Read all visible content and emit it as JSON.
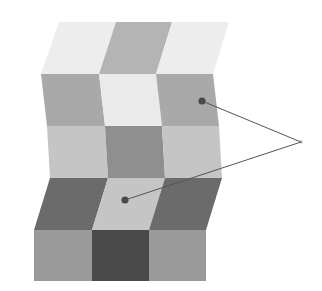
{
  "figure": {
    "kind": "wavy-checkerboard-lightness-illusion",
    "background_color": "#ffffff",
    "canvas": {
      "width": 322,
      "height": 291
    }
  },
  "palette": {
    "near_white": "#f1f1f1",
    "very_light_gray": "#e4e4e4",
    "light_gray": "#c9c9c9",
    "mid_light_gray": "#bdbdbd",
    "mid_gray": "#aaaaaa",
    "mid_dark_gray": "#949494",
    "dark_gray": "#6f6f6f",
    "darker_gray": "#5d5d5d",
    "darkest_gray": "#454545",
    "line_color": "#555555",
    "dot_color": "#4a4a4a"
  },
  "surface": {
    "columns": 3,
    "rows": 5,
    "description": "Folded wavy checkerboard surface rendered as sheared parallelogram tiles; alternating light and dark checks whose rendered luminance changes with the fold of the surface.",
    "column_top_x": [
      59,
      116,
      172
    ],
    "column_shear": [
      [
        0,
        0,
        0,
        0
      ],
      [
        0,
        0,
        0,
        0
      ],
      [
        0,
        0,
        0,
        0
      ]
    ],
    "row_boundaries_y": [
      22,
      74,
      126,
      178,
      230,
      281
    ],
    "tiles": [
      {
        "id": "r0c0",
        "row": 0,
        "col": 0,
        "check": "light",
        "fill": "#ededed",
        "points": "59,22 116,22 99,74 41,74"
      },
      {
        "id": "r0c1",
        "row": 0,
        "col": 1,
        "check": "dark",
        "fill": "#b4b4b4",
        "points": "116,22 172,22 156,74 99,74"
      },
      {
        "id": "r0c2",
        "row": 0,
        "col": 2,
        "check": "light",
        "fill": "#ededed",
        "points": "172,22 229,22 213,74 156,74"
      },
      {
        "id": "r1c0",
        "row": 1,
        "col": 0,
        "check": "dark",
        "fill": "#a9a9a9",
        "points": "41,74 99,74 105,126 47,126"
      },
      {
        "id": "r1c1",
        "row": 1,
        "col": 1,
        "check": "light",
        "fill": "#eaeaea",
        "points": "99,74 156,74 162,126 105,126"
      },
      {
        "id": "r1c2",
        "row": 1,
        "col": 2,
        "check": "dark",
        "fill": "#a9a9a9",
        "points": "156,74 213,74 219,126 162,126"
      },
      {
        "id": "r2c0",
        "row": 2,
        "col": 0,
        "check": "light",
        "fill": "#c5c5c5",
        "points": "47,126 105,126 108,178 50,178"
      },
      {
        "id": "r2c1",
        "row": 2,
        "col": 1,
        "check": "dark",
        "fill": "#8f8f8f",
        "points": "105,126 162,126 165,178 108,178"
      },
      {
        "id": "r2c2",
        "row": 2,
        "col": 2,
        "check": "light",
        "fill": "#c5c5c5",
        "points": "162,126 219,126 222,178 165,178"
      },
      {
        "id": "r3c0",
        "row": 3,
        "col": 0,
        "check": "dark",
        "fill": "#6b6b6b",
        "points": "50,178 108,178 92,230 34,230"
      },
      {
        "id": "r3c1",
        "row": 3,
        "col": 1,
        "check": "light",
        "fill": "#c5c5c5",
        "points": "108,178 165,178 149,230 92,230"
      },
      {
        "id": "r3c2",
        "row": 3,
        "col": 2,
        "check": "dark",
        "fill": "#6b6b6b",
        "points": "165,178 222,178 206,230 149,230"
      },
      {
        "id": "r4c0",
        "row": 4,
        "col": 0,
        "check": "light",
        "fill": "#9a9a9a",
        "points": "34,230 92,230 92,281 34,281"
      },
      {
        "id": "r4c1",
        "row": 4,
        "col": 1,
        "check": "dark",
        "fill": "#4a4a4a",
        "points": "92,230 149,230 149,281 92,281"
      },
      {
        "id": "r4c2",
        "row": 4,
        "col": 2,
        "check": "light",
        "fill": "#9a9a9a",
        "points": "149,230 206,230 206,281 149,281"
      }
    ]
  },
  "annotations": {
    "convergence_vertex": {
      "x": 301,
      "y": 142
    },
    "markers": [
      {
        "id": "upper-marker",
        "label_role": "dark-appearing check on shaded fold",
        "x": 202,
        "y": 101,
        "radius": 3.6
      },
      {
        "id": "lower-marker",
        "label_role": "light-appearing check on lit fold",
        "x": 125,
        "y": 200,
        "radius": 3.6
      }
    ],
    "leader_lines": [
      {
        "id": "upper-leader",
        "from": [
          202,
          101
        ],
        "to": [
          301,
          142
        ]
      },
      {
        "id": "lower-leader",
        "from": [
          125,
          200
        ],
        "to": [
          301,
          142
        ]
      }
    ]
  }
}
